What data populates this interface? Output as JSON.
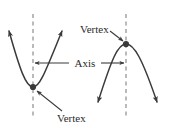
{
  "figure": {
    "background_color": "#ffffff",
    "curve_color": "#3a3a3a",
    "dashed_line_color": "#8d8d8d",
    "label_color": "#2b2b2b",
    "labels": {
      "vertex_top": "Vertex",
      "vertex_bottom": "Vertex",
      "axis": "Axis"
    },
    "elements": {
      "left_parabola": {
        "opens": "up",
        "vertex": {
          "x": 33,
          "y": 87
        },
        "arrow_tips": [
          {
            "x": 8,
            "y": 28
          },
          {
            "x": 63,
            "y": 28
          }
        ]
      },
      "right_parabola": {
        "opens": "down",
        "vertex": {
          "x": 126,
          "y": 44
        },
        "arrow_tips": [
          {
            "x": 97,
            "y": 106
          },
          {
            "x": 158,
            "y": 106
          }
        ]
      },
      "left_axis_line": {
        "x": 33,
        "y_top": 14,
        "y_bottom": 118
      },
      "right_axis_line": {
        "x": 126,
        "y_top": 14,
        "y_bottom": 118
      },
      "axis_measure_arrow": {
        "x_start": 33,
        "x_end": 126,
        "y": 63
      }
    }
  }
}
